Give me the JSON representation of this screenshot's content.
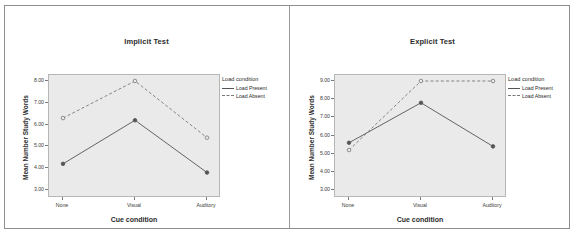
{
  "top_clipped_text": "",
  "legend": {
    "title": "Load condition",
    "entries": [
      {
        "label": "Load Present",
        "style": "solid",
        "color": "#555555"
      },
      {
        "label": "Load Absent",
        "style": "dashed",
        "color": "#777777"
      }
    ]
  },
  "axis": {
    "xlabel": "Cue condition",
    "ylabel": "Mean Number Study Words",
    "categories": [
      "None",
      "Visual",
      "Auditory"
    ]
  },
  "chart_data": [
    {
      "type": "line",
      "title": "Implicit Test",
      "xlabel": "Cue condition",
      "ylabel": "Mean Number Study Words",
      "categories": [
        "None",
        "Visual",
        "Auditory"
      ],
      "ylim": [
        3.0,
        8.0
      ],
      "yticks": [
        "3.00",
        "4.00",
        "5.00",
        "6.00",
        "7.00",
        "8.00"
      ],
      "grid": false,
      "legend_position": "right",
      "legend_title": "Load condition",
      "series": [
        {
          "name": "Load Present",
          "style": "solid",
          "color": "#555555",
          "values": [
            4.2,
            6.2,
            3.8
          ]
        },
        {
          "name": "Load Absent",
          "style": "dashed",
          "color": "#777777",
          "values": [
            6.3,
            8.0,
            5.4
          ]
        }
      ]
    },
    {
      "type": "line",
      "title": "Explicit Test",
      "xlabel": "Cue condition",
      "ylabel": "Mean Number Study Words",
      "categories": [
        "None",
        "Visual",
        "Auditory"
      ],
      "ylim": [
        3.0,
        9.0
      ],
      "yticks": [
        "3.00",
        "4.00",
        "5.00",
        "6.00",
        "7.00",
        "8.00",
        "9.00"
      ],
      "grid": false,
      "legend_position": "right",
      "legend_title": "Load condition",
      "series": [
        {
          "name": "Load Present",
          "style": "solid",
          "color": "#555555",
          "values": [
            5.6,
            7.8,
            5.4
          ]
        },
        {
          "name": "Load Absent",
          "style": "dashed",
          "color": "#777777",
          "values": [
            5.2,
            9.0,
            9.0
          ]
        }
      ]
    }
  ]
}
